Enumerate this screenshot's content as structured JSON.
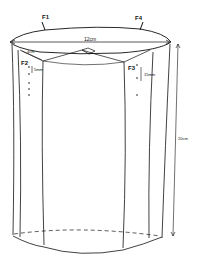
{
  "diagram": {
    "type": "cylinder-sketch",
    "labels": {
      "f1": "F1",
      "f2": "F2",
      "f3": "F3",
      "f4": "F4",
      "diameter": "12cm",
      "height": "20cm",
      "inner_gap": "4cm",
      "spacing_f2": "5mm",
      "spacing_f3": "15mm"
    },
    "colors": {
      "stroke": "#111111",
      "background": "#ffffff"
    }
  }
}
